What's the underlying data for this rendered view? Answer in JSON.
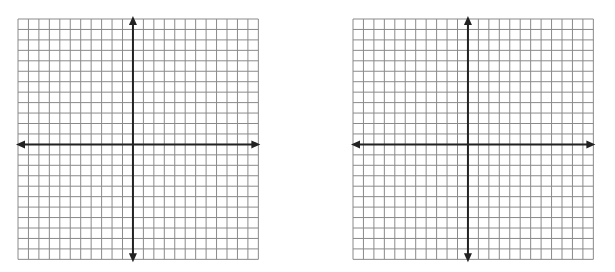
{
  "graphs": [
    {
      "left": 18,
      "top": 19,
      "cols": 23,
      "rows": 23,
      "cell": 10.45,
      "origin_col": 11,
      "origin_row": 12
    },
    {
      "left": 353,
      "top": 19,
      "cols": 23,
      "rows": 23,
      "cell": 10.45,
      "origin_col": 11,
      "origin_row": 12
    }
  ],
  "colors": {
    "grid_line": "#8a8a8a",
    "axis": "#222222",
    "background": "#ffffff"
  }
}
